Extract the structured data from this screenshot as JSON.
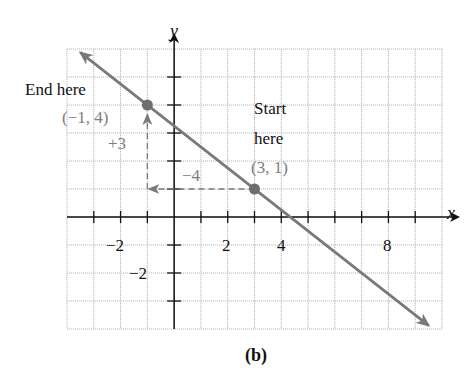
{
  "chart_data": {
    "type": "line",
    "title": "",
    "caption": "(b)",
    "xlabel": "x",
    "ylabel": "y",
    "xlim": [
      -4,
      10
    ],
    "ylim": [
      -4,
      6
    ],
    "grid": true,
    "x_tick_labels": [
      {
        "value": -2,
        "label": "−2"
      },
      {
        "value": 2,
        "label": "2"
      },
      {
        "value": 4,
        "label": "4"
      },
      {
        "value": 8,
        "label": "8"
      }
    ],
    "y_tick_labels": [
      {
        "value": -2,
        "label": "−2"
      }
    ],
    "series": [
      {
        "name": "line",
        "slope": -0.75,
        "intercept": 3.25,
        "x": [
          -3.5,
          9.5
        ],
        "y": [
          5.875,
          -3.875
        ],
        "color": "#7a7a7a"
      }
    ],
    "points": [
      {
        "x": -1,
        "y": 4,
        "label": "(−1, 4)",
        "note": "End here"
      },
      {
        "x": 3,
        "y": 1,
        "label": "(3, 1)",
        "note": "Start here"
      }
    ],
    "annotations": [
      {
        "text": "End here",
        "x": -1,
        "y": 4
      },
      {
        "text": "Start here",
        "x": 3,
        "y": 1
      },
      {
        "text": "−4",
        "type": "run",
        "from": [
          3,
          1
        ],
        "to": [
          -1,
          1
        ]
      },
      {
        "text": "+3",
        "type": "rise",
        "from": [
          -1,
          1
        ],
        "to": [
          -1,
          4
        ]
      }
    ]
  },
  "labels": {
    "x_axis": "x",
    "y_axis": "y",
    "end_here": "End here",
    "end_point": "(−1, 4)",
    "rise": "+3",
    "run": "−4",
    "start_line1": "Start",
    "start_line2": "here",
    "start_point": "(3, 1)",
    "tick_x_neg2": "−2",
    "tick_x_2": "2",
    "tick_x_4": "4",
    "tick_x_8": "8",
    "tick_y_neg2": "−2",
    "caption": "(b)"
  },
  "colors": {
    "axis": "#111111",
    "grid": "#b8b8b8",
    "line": "#7a7a7a",
    "point": "#6e6e6e",
    "annotation": "#7d7d7d"
  }
}
